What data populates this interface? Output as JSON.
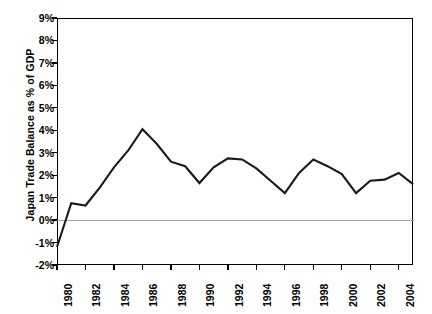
{
  "chart_data": {
    "type": "line",
    "title": "",
    "xlabel": "",
    "ylabel": "Japan Trade Balance as % of GDP",
    "xlim": [
      1980,
      2005
    ],
    "ylim": [
      -2,
      9
    ],
    "grid": false,
    "legend": null,
    "zero_reference_line": true,
    "y_tick_labels": [
      "9%",
      "8%",
      "7%",
      "6%",
      "5%",
      "4%",
      "3%",
      "2%",
      "1%",
      "0%",
      "-1%",
      "-2%"
    ],
    "y_tick_values": [
      9,
      8,
      7,
      6,
      5,
      4,
      3,
      2,
      1,
      0,
      -1,
      -2
    ],
    "x_tick_labels": [
      "1980",
      "1982",
      "1984",
      "1986",
      "1988",
      "1990",
      "1992",
      "1994",
      "1996",
      "1998",
      "2000",
      "2002",
      "2004"
    ],
    "x_tick_values": [
      1980,
      1982,
      1984,
      1986,
      1988,
      1990,
      1992,
      1994,
      1996,
      1998,
      2000,
      2002,
      2004
    ],
    "x": [
      1980,
      1981,
      1982,
      1983,
      1984,
      1985,
      1986,
      1987,
      1988,
      1989,
      1990,
      1991,
      1992,
      1993,
      1994,
      1995,
      1996,
      1997,
      1998,
      1999,
      2000,
      2001,
      2002,
      2003,
      2004,
      2005
    ],
    "series": [
      {
        "name": "Japan Trade Balance as % of GDP",
        "color": "#1a1a1a",
        "values": [
          -1.2,
          0.75,
          0.65,
          1.45,
          2.35,
          3.1,
          4.05,
          3.4,
          2.6,
          2.4,
          1.65,
          2.35,
          2.75,
          2.7,
          2.3,
          1.75,
          1.2,
          2.1,
          2.7,
          2.4,
          2.05,
          1.2,
          1.75,
          1.8,
          2.1,
          1.6
        ]
      }
    ]
  },
  "axis": {
    "y_title": "Japan Trade Balance as % of GDP"
  }
}
